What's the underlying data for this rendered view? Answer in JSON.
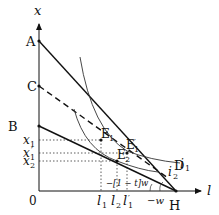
{
  "diagram": {
    "axes": {
      "x_axis_label": "l",
      "y_axis_label": "x",
      "origin_label": "0"
    },
    "points": {
      "A": "A",
      "C": "C",
      "B": "B",
      "D": "D",
      "H": "H",
      "E1": "E",
      "E1_sub": "1",
      "E1p": "E",
      "E1p_sub": "1",
      "E1p_prime": "′",
      "E2": "E",
      "E2_sub": "2"
    },
    "y_ticks": {
      "x1": "x",
      "x1_sub": "1",
      "x1p": "x",
      "x1p_sub": "1",
      "x1p_prime": "′",
      "x2": "x",
      "x2_sub": "2"
    },
    "x_ticks": {
      "l1": "l",
      "l1_sub": "1",
      "l2": "l",
      "l2_sub": "2",
      "l1p": "l",
      "l1p_sub": "1",
      "l1p_prime": "′",
      "neg_w": "−w"
    },
    "curves": {
      "i1": "i",
      "i1_sub": "1",
      "i2": "i",
      "i2_sub": "2"
    },
    "annotation": "−[1 − t]w"
  }
}
